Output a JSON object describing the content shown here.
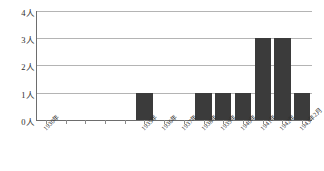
{
  "chart_data": {
    "type": "bar",
    "title": "",
    "subtitle": "",
    "xlabel": "",
    "ylabel": "",
    "categories": [
      "1930年",
      "1931年",
      "1932年",
      "1933年",
      "1934年",
      "1935年",
      "1936年",
      "1937年",
      "1938年",
      "1939年",
      "1940年",
      "1941年",
      "1942年",
      "1943年2月"
    ],
    "values": [
      0,
      0,
      0,
      0,
      0,
      1,
      0,
      0,
      1,
      1,
      1,
      3,
      3,
      1
    ],
    "ylim": [
      0,
      4
    ],
    "yticks": [
      0,
      1,
      2,
      3,
      4
    ],
    "ytick_labels": [
      "0人",
      "1人",
      "2人",
      "3人",
      "4人"
    ],
    "xtick_labels_shown": [
      "1930年",
      "1935年",
      "1936年",
      "1937年",
      "1938年",
      "1939年",
      "1940年",
      "1941年",
      "1942年",
      "1943年2月"
    ],
    "grid": true,
    "legend": false,
    "legend_position": "none",
    "bar_color": "#3b3b3b",
    "gridline_color": "#b4b4b4",
    "axis_color": "#6d6d6d",
    "unit_suffix": "人"
  }
}
